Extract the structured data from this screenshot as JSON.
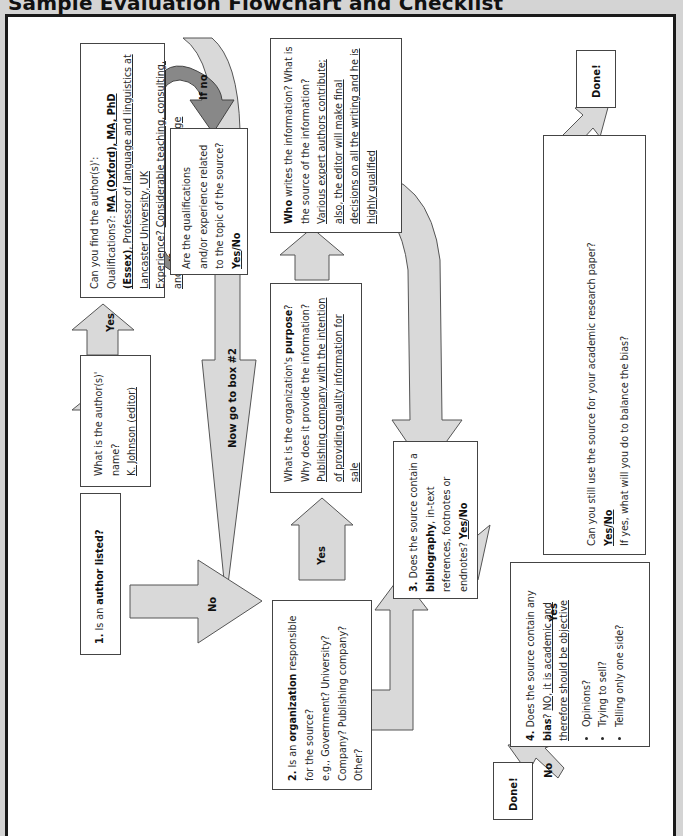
{
  "title": "Sample Evaluation Flowchart and Checklist",
  "box1": {
    "number": "1.",
    "text": " Is an ",
    "bold": "author listed",
    "end": "?"
  },
  "author_name": {
    "q": "What is the author(s)' name?",
    "answer": "K. Johnson (editor)"
  },
  "qualifications": {
    "q": "Can you find the author(s)':",
    "qual_label": "Qualifications?: ",
    "qual_bold": "MA (Oxford), MA, PhD (Essex)",
    "qual_rest": "Professor of language and linguistics at Lancaster University, UK",
    "exp_label": "Experience? ",
    "exp_answer": "Considerable teaching, consulting, and publishing on topic of language"
  },
  "related": {
    "q": "Are the qualifications and/or experience related to the topic of the source? ",
    "yes": "Yes",
    "sep": "/",
    "no": "No"
  },
  "box2": {
    "number": "2.",
    "pre": " Is an ",
    "bold": "organization",
    "post": " responsible for the source?",
    "line2": "e.g., Government? University? Company? Publishing company? Other?"
  },
  "purpose": {
    "pre": "What is the organization's ",
    "bold": "purpose",
    "post": "? Why does it provide the information?",
    "answer": "Publishing company with the intention of providing quality information for sale"
  },
  "who": {
    "bold": "Who",
    "post": " writes the information? What is the source of the information? ",
    "answer": "Various expert authors contribute; also, the editor will make final decisions on all the writing and he is highly qualified"
  },
  "box3": {
    "number": "3.",
    "pre": " Does the source contain a ",
    "bold": "bibliography",
    "post": ", in-text references, footnotes or endnotes? ",
    "yes": "Yes",
    "sep": "/",
    "no": "No"
  },
  "box4": {
    "number": "4.",
    "pre": " Does the source contain any ",
    "bold": "bias",
    "post": "? ",
    "answer": "NO, it is academic and therefore should be objective",
    "bullets": [
      "Opinions?",
      "Trying to sell?",
      "Telling only one side?"
    ]
  },
  "use": {
    "q": "Can you still use the source for your academic research paper?",
    "yes": "Yes",
    "sep": "/",
    "no": "No",
    "q2": "If yes, what will you do to balance the bias?"
  },
  "arrows": {
    "yes": "Yes",
    "no": "No",
    "if_no": "If no",
    "if_yes": "If yes",
    "go_box2": "Now go to box #2"
  },
  "done": "Done!",
  "colors": {
    "arrow_fill": "#d9d9d9",
    "arrow_stroke": "#555555",
    "curved_arrow": "#888888"
  }
}
